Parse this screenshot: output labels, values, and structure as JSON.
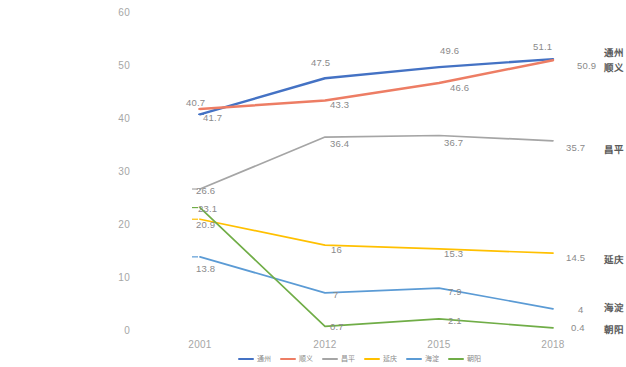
{
  "chart_data": {
    "type": "line",
    "title": "",
    "xlabel": "",
    "ylabel": "",
    "categories": [
      "2001",
      "2012",
      "2015",
      "2018"
    ],
    "yticks": [
      0,
      10,
      20,
      30,
      40,
      50,
      60
    ],
    "ylim": [
      0,
      60
    ],
    "grid": false,
    "legend_position": "bottom",
    "series": [
      {
        "name": "通州",
        "color": "#4472c4",
        "values": [
          40.7,
          47.5,
          49.6,
          51.1
        ],
        "labels": [
          "40.7",
          "47.5",
          "49.6",
          "51.1"
        ]
      },
      {
        "name": "顺义",
        "color": "#ed7d64",
        "values": [
          41.7,
          43.3,
          46.6,
          50.9
        ],
        "labels": [
          "41.7",
          "43.3",
          "46.6",
          "50.9"
        ]
      },
      {
        "name": "昌平",
        "color": "#a5a5a5",
        "values": [
          26.6,
          36.4,
          36.7,
          35.7
        ],
        "labels": [
          "26.6",
          "36.4",
          "36.7",
          "35.7"
        ]
      },
      {
        "name": "延庆",
        "color": "#ffc000",
        "values": [
          20.9,
          16.0,
          15.3,
          14.5
        ],
        "labels": [
          "20.9",
          "16",
          "15.3",
          "14.5"
        ]
      },
      {
        "name": "海淀",
        "color": "#5b9bd5",
        "values": [
          13.8,
          7.0,
          7.9,
          4.0
        ],
        "labels": [
          "13.8",
          "7",
          "7.9",
          "4"
        ]
      },
      {
        "name": "朝阳",
        "color": "#70ad47",
        "values": [
          23.1,
          0.7,
          2.1,
          0.4
        ],
        "labels": [
          "23.1",
          "0.7",
          "2.1",
          "0.4"
        ]
      }
    ]
  },
  "axis": {
    "y_tick_labels": [
      "60",
      "50",
      "40",
      "30",
      "20",
      "10",
      "0"
    ],
    "x_tick_labels": [
      "2001",
      "2012",
      "2015",
      "2018"
    ]
  },
  "series_end_labels": [
    {
      "name": "通州"
    },
    {
      "name": "顺义"
    },
    {
      "name": "昌平"
    },
    {
      "name": "延庆"
    },
    {
      "name": "海淀"
    },
    {
      "name": "朝阳"
    }
  ],
  "legend": {
    "items": [
      "通州",
      "顺义",
      "昌平",
      "延庆",
      "海淀",
      "朝阳"
    ]
  }
}
